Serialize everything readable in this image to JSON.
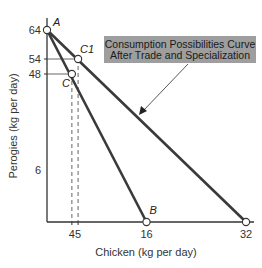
{
  "chart_data": {
    "type": "line",
    "title": "",
    "xlabel": "Chicken (kg per day)",
    "ylabel": "Perogies (kg per day)",
    "xlim": [
      0,
      32
    ],
    "ylim": [
      0,
      64
    ],
    "grid": false,
    "x_ticks": [
      "4",
      "5",
      "16",
      "32"
    ],
    "y_ticks": [
      "64",
      "54",
      "48",
      "6"
    ],
    "series": [
      {
        "name": "Production Possibilities Curve",
        "points": [
          {
            "x": 0,
            "y": 64
          },
          {
            "x": 16,
            "y": 0
          }
        ]
      },
      {
        "name": "Consumption Possibilities Curve After Trade and Specialization",
        "points": [
          {
            "x": 0,
            "y": 64
          },
          {
            "x": 32,
            "y": 0
          }
        ]
      }
    ],
    "points": [
      {
        "label": "A",
        "x": 0,
        "y": 64
      },
      {
        "label": "C1",
        "x": 5,
        "y": 54
      },
      {
        "label": "C",
        "x": 4,
        "y": 48
      },
      {
        "label": "B",
        "x": 16,
        "y": 0
      },
      {
        "label": "",
        "x": 32,
        "y": 0
      }
    ],
    "guides": [
      {
        "x": 4,
        "y": 48
      },
      {
        "x": 5,
        "y": 54
      }
    ],
    "annotations": [
      {
        "text_lines": [
          "Consumption Possibilities Curve",
          "After Trade and Specialization"
        ],
        "points_to": "Consumption Possibilities Curve After Trade and Specialization"
      }
    ]
  }
}
